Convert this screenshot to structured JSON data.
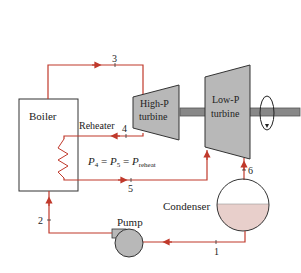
{
  "diagram": {
    "components": {
      "boiler": "Boiler",
      "reheater": "Reheater",
      "high_p_turbine": [
        "High-P",
        "turbine"
      ],
      "low_p_turbine": [
        "Low-P",
        "turbine"
      ],
      "condenser": "Condenser",
      "pump": "Pump"
    },
    "states": [
      "1",
      "2",
      "3",
      "4",
      "5",
      "6"
    ],
    "equation": {
      "p4": "P",
      "sub4": "4",
      "eq1": " = ",
      "p5": "P",
      "sub5": "5",
      "eq2": " = ",
      "preheat": "P",
      "subreheat": "reheat"
    },
    "colors": {
      "pipe": "#c0392b",
      "machine": "#b8b8b8",
      "condensate": "#e8cfcb",
      "outline": "#333333"
    }
  }
}
